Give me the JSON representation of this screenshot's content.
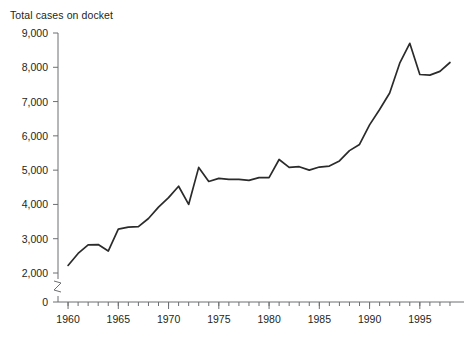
{
  "figure": {
    "cropped_top_line": "",
    "axis_title": "Total cases on docket"
  },
  "chart_data": {
    "type": "line",
    "title": "",
    "subtitle": "",
    "xlabel": "",
    "ylabel": "Total cases on docket",
    "grid": false,
    "legend": null,
    "xlim": [
      1959,
      1998.5
    ],
    "ylim": [
      0,
      9000
    ],
    "y_axis_break": {
      "present": true,
      "between": [
        0,
        2000
      ],
      "style": "zigzag"
    },
    "ytick_labels": [
      "0",
      "2,000",
      "3,000",
      "4,000",
      "5,000",
      "6,000",
      "7,000",
      "8,000",
      "9,000"
    ],
    "ytick_values": [
      0,
      2000,
      3000,
      4000,
      5000,
      6000,
      7000,
      8000,
      9000
    ],
    "xtick_labels": [
      "1960",
      "1965",
      "1970",
      "1975",
      "1980",
      "1985",
      "1990",
      "1995"
    ],
    "xtick_values": [
      1960,
      1965,
      1970,
      1975,
      1980,
      1985,
      1990,
      1995
    ],
    "xtick_minor_step": 1,
    "line_color": "#2b2b2b",
    "series": [
      {
        "name": "Total cases on docket",
        "x": [
          1960,
          1961,
          1962,
          1963,
          1964,
          1965,
          1966,
          1967,
          1968,
          1969,
          1970,
          1971,
          1972,
          1973,
          1974,
          1975,
          1976,
          1977,
          1978,
          1979,
          1980,
          1981,
          1982,
          1983,
          1984,
          1985,
          1986,
          1987,
          1988,
          1989,
          1990,
          1991,
          1992,
          1993,
          1994,
          1995,
          1996,
          1997,
          1998
        ],
        "values": [
          2220,
          2570,
          2820,
          2830,
          2640,
          3280,
          3340,
          3350,
          3590,
          3920,
          4200,
          4530,
          4000,
          5080,
          4670,
          4760,
          4730,
          4730,
          4700,
          4780,
          4780,
          5310,
          5080,
          5100,
          5000,
          5090,
          5120,
          5270,
          5570,
          5750,
          6320,
          6770,
          7250,
          8120,
          8700,
          7790,
          7770,
          7880,
          8140
        ]
      }
    ]
  }
}
